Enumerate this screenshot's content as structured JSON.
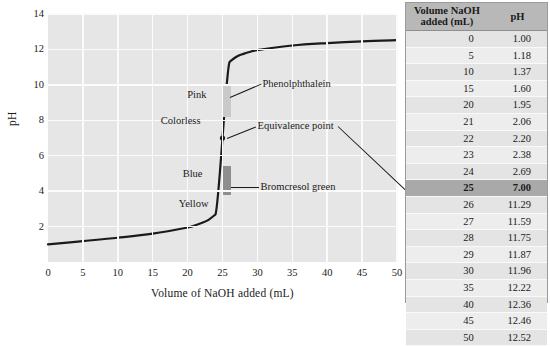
{
  "chart_data": {
    "type": "line",
    "title": "",
    "xlabel": "Volume of NaOH added (mL)",
    "ylabel": "pH",
    "xlim": [
      0,
      50
    ],
    "ylim": [
      0,
      14
    ],
    "xticks": [
      0,
      5,
      10,
      15,
      20,
      25,
      30,
      35,
      40,
      45,
      50
    ],
    "yticks": [
      2,
      4,
      6,
      8,
      10,
      12,
      14
    ],
    "grid": true,
    "legend": "none",
    "x": [
      0,
      5,
      10,
      15,
      20,
      21,
      22,
      23,
      24,
      25,
      26,
      27,
      28,
      29,
      30,
      35,
      40,
      45,
      50
    ],
    "y": [
      1.0,
      1.18,
      1.37,
      1.6,
      1.95,
      2.06,
      2.2,
      2.38,
      2.69,
      7.0,
      11.29,
      11.59,
      11.75,
      11.87,
      11.96,
      12.22,
      12.36,
      12.46,
      12.52
    ],
    "annotations": [
      {
        "name": "phenolphthalein",
        "label": "Phenolphthalein",
        "ph_low": 8.2,
        "ph_high": 10.0
      },
      {
        "name": "equivalence-point",
        "label": "Equivalence point",
        "volume": 25,
        "ph": 7.0
      },
      {
        "name": "bromcresol-green",
        "label": "Bromcresol green",
        "ph_low": 3.8,
        "ph_high": 5.4
      }
    ],
    "indicator_color_labels": [
      {
        "name": "pink",
        "label": "Pink"
      },
      {
        "name": "colorless",
        "label": "Colorless"
      },
      {
        "name": "blue",
        "label": "Blue"
      },
      {
        "name": "yellow",
        "label": "Yellow"
      }
    ]
  },
  "chart": {
    "ylabel": "pH",
    "xlabel": "Volume of NaOH added (mL)",
    "yticks": [
      "14",
      "12",
      "10",
      "8",
      "6",
      "4",
      "2"
    ],
    "xticks": [
      "0",
      "5",
      "10",
      "15",
      "20",
      "25",
      "30",
      "35",
      "40",
      "45",
      "50"
    ],
    "labels": {
      "pink": "Pink",
      "colorless": "Colorless",
      "blue": "Blue",
      "yellow": "Yellow",
      "phenolphthalein": "Phenolphthalein",
      "equivalence_point": "Equivalence point",
      "bromcresol_green": "Bromcresol green"
    }
  },
  "table": {
    "headers": {
      "volume": "Volume NaOH added (mL)",
      "volume_line1": "Volume NaOH",
      "volume_line2": "added (mL)",
      "ph": "pH"
    },
    "rows": [
      {
        "volume": "0",
        "ph": "1.00",
        "highlight": false
      },
      {
        "volume": "5",
        "ph": "1.18",
        "highlight": false
      },
      {
        "volume": "10",
        "ph": "1.37",
        "highlight": false
      },
      {
        "volume": "15",
        "ph": "1.60",
        "highlight": false
      },
      {
        "volume": "20",
        "ph": "1.95",
        "highlight": false
      },
      {
        "volume": "21",
        "ph": "2.06",
        "highlight": false
      },
      {
        "volume": "22",
        "ph": "2.20",
        "highlight": false
      },
      {
        "volume": "23",
        "ph": "2.38",
        "highlight": false
      },
      {
        "volume": "24",
        "ph": "2.69",
        "highlight": false
      },
      {
        "volume": "25",
        "ph": "7.00",
        "highlight": true
      },
      {
        "volume": "26",
        "ph": "11.29",
        "highlight": false
      },
      {
        "volume": "27",
        "ph": "11.59",
        "highlight": false
      },
      {
        "volume": "28",
        "ph": "11.75",
        "highlight": false
      },
      {
        "volume": "29",
        "ph": "11.87",
        "highlight": false
      },
      {
        "volume": "30",
        "ph": "11.96",
        "highlight": false
      },
      {
        "volume": "35",
        "ph": "12.22",
        "highlight": false
      },
      {
        "volume": "40",
        "ph": "12.36",
        "highlight": false
      },
      {
        "volume": "45",
        "ph": "12.46",
        "highlight": false
      },
      {
        "volume": "50",
        "ph": "12.52",
        "highlight": false
      }
    ]
  },
  "colors": {
    "plot_background": "#e6e6e6",
    "gridline": "#fbfbfb",
    "curve": "#1a1a1a",
    "phenolphthalein_bar": "#c9c9c9",
    "bromcresol_green_bar": "#8e8e8e",
    "table_header": "#b8b8b8",
    "table_highlight": "#a9a9a9"
  }
}
